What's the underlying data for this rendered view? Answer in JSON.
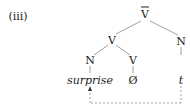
{
  "example_label": "(iii)",
  "tree": {
    "root": "V",
    "root_bar": true,
    "nodes": {
      "v_mid": "V",
      "n_right": "N",
      "n_left": "N",
      "v_right": "V"
    },
    "leaves": {
      "surprise": "surprise",
      "null": "Ø",
      "trace": "t"
    },
    "movement": "dashed arrow from trace t to surprise"
  }
}
